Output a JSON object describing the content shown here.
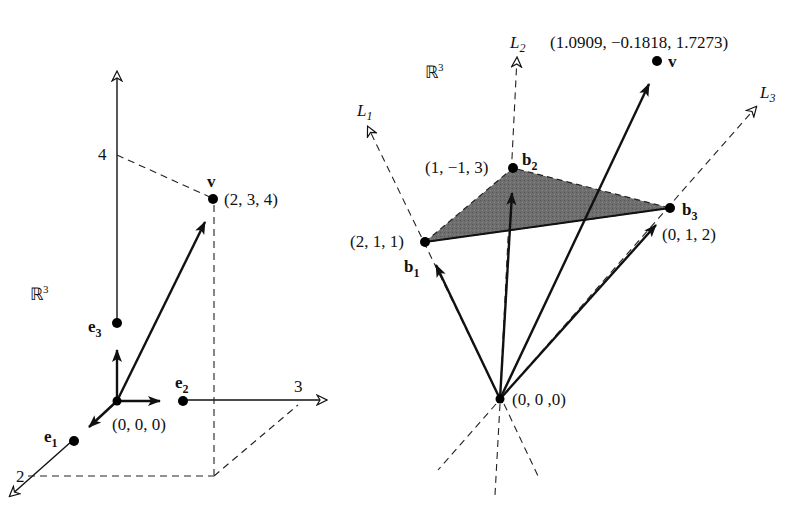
{
  "left_panel": {
    "space_label": "ℝ",
    "space_sup": "3",
    "origin_label": "(0, 0, 0)",
    "v_name": "v",
    "v_coords": "(2, 3, 4)",
    "axis_tick_z": "4",
    "axis_tick_y": "3",
    "axis_tick_x": "2",
    "e1": {
      "name": "e",
      "sub": "1"
    },
    "e2": {
      "name": "e",
      "sub": "2"
    },
    "e3": {
      "name": "e",
      "sub": "3"
    }
  },
  "right_panel": {
    "space_label": "ℝ",
    "space_sup": "3",
    "origin_label": "(0, 0 ,0)",
    "v_name": "v",
    "v_coords": "(1.0909, −0.1818, 1.7273)",
    "lines": [
      {
        "name": "L",
        "sub": "1"
      },
      {
        "name": "L",
        "sub": "2"
      },
      {
        "name": "L",
        "sub": "3"
      }
    ],
    "b1": {
      "name": "b",
      "sub": "1",
      "coords": "(2, 1, 1)"
    },
    "b2": {
      "name": "b",
      "sub": "2",
      "coords": "(1, −1, 3)"
    },
    "b3": {
      "name": "b",
      "sub": "3",
      "coords": "(0, 1, 2)"
    },
    "triangle_fill": "#6e6e6e"
  }
}
